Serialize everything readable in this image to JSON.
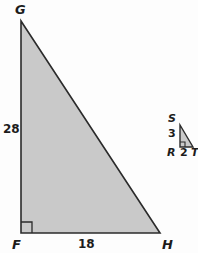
{
  "figure": {
    "type": "geometry-diagram",
    "background_color": "#fdfdfd",
    "fill_color": "#c9c9c9",
    "stroke_color": "#2b2b2b"
  },
  "large_triangle": {
    "name": "triangle-FGH",
    "vertices": [
      {
        "name": "G",
        "label": "G",
        "x": 21,
        "y": 21
      },
      {
        "name": "F",
        "label": "F",
        "x": 21,
        "y": 233
      },
      {
        "name": "H",
        "label": "H",
        "x": 160,
        "y": 233
      }
    ],
    "side_labels": [
      {
        "name": "leg-GF",
        "label": "28"
      },
      {
        "name": "leg-FH",
        "label": "18"
      }
    ],
    "right_angle_at": "F"
  },
  "small_triangle": {
    "name": "triangle-RST",
    "vertices": [
      {
        "name": "S",
        "label": "S",
        "x": 180,
        "y": 125
      },
      {
        "name": "R",
        "label": "R",
        "x": 180,
        "y": 147
      },
      {
        "name": "T",
        "label": "T",
        "x": 193,
        "y": 147
      }
    ],
    "side_labels": [
      {
        "name": "leg-SR",
        "label": "3"
      },
      {
        "name": "leg-RT",
        "label": "2"
      }
    ],
    "right_angle_at": "R"
  }
}
